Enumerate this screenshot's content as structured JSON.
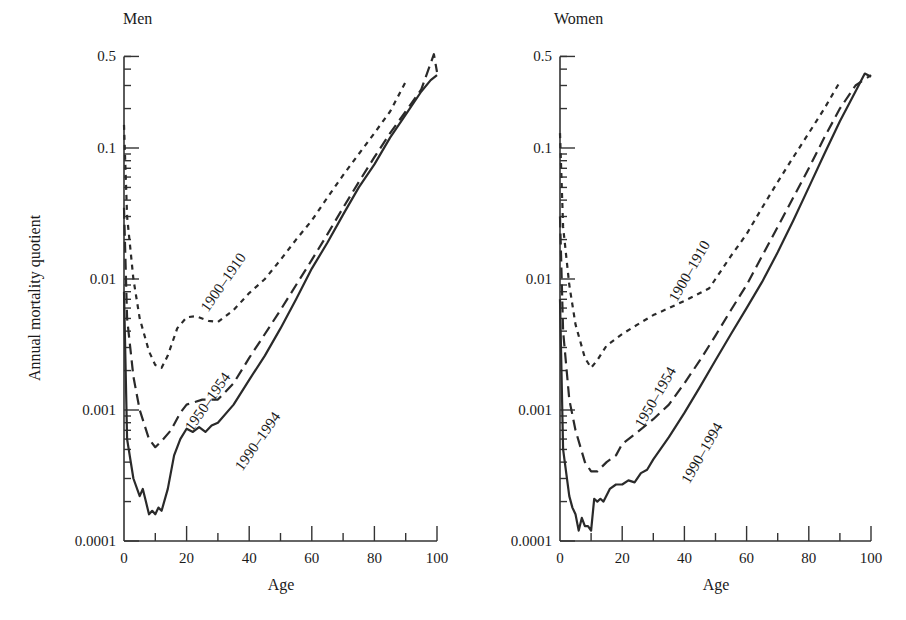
{
  "chart_data": [
    {
      "type": "line",
      "title": "Men",
      "xlabel": "Age",
      "ylabel": "Annual mortality quotient",
      "yscale": "log",
      "xlim": [
        0,
        100
      ],
      "ylim": [
        0.0001,
        0.5
      ],
      "x_ticks": [
        "0",
        "20",
        "40",
        "60",
        "80",
        "100"
      ],
      "y_ticks": [
        "0.0001",
        "0.001",
        "0.01",
        "0.1",
        "0.5"
      ],
      "grid": false,
      "series": [
        {
          "name": "1900–1910",
          "style": "dotted",
          "label": "1900–1910",
          "points": [
            [
              0,
              0.15
            ],
            [
              1,
              0.03
            ],
            [
              3,
              0.01
            ],
            [
              5,
              0.005
            ],
            [
              8,
              0.0028
            ],
            [
              10,
              0.0022
            ],
            [
              12,
              0.0021
            ],
            [
              14,
              0.0026
            ],
            [
              17,
              0.0042
            ],
            [
              20,
              0.0051
            ],
            [
              23,
              0.0052
            ],
            [
              27,
              0.0048
            ],
            [
              30,
              0.0047
            ],
            [
              35,
              0.0058
            ],
            [
              40,
              0.0078
            ],
            [
              45,
              0.01
            ],
            [
              50,
              0.014
            ],
            [
              55,
              0.02
            ],
            [
              60,
              0.028
            ],
            [
              65,
              0.042
            ],
            [
              70,
              0.062
            ],
            [
              75,
              0.09
            ],
            [
              80,
              0.13
            ],
            [
              85,
              0.19
            ],
            [
              90,
              0.32
            ]
          ]
        },
        {
          "name": "1950–1954",
          "style": "dashed",
          "label": "1950–1954",
          "points": [
            [
              0,
              0.035
            ],
            [
              1,
              0.005
            ],
            [
              3,
              0.0018
            ],
            [
              5,
              0.001
            ],
            [
              8,
              0.0006
            ],
            [
              10,
              0.00052
            ],
            [
              12,
              0.00058
            ],
            [
              15,
              0.0007
            ],
            [
              18,
              0.00095
            ],
            [
              20,
              0.0011
            ],
            [
              25,
              0.0012
            ],
            [
              30,
              0.0012
            ],
            [
              35,
              0.0016
            ],
            [
              40,
              0.0025
            ],
            [
              45,
              0.0038
            ],
            [
              50,
              0.0058
            ],
            [
              55,
              0.009
            ],
            [
              60,
              0.014
            ],
            [
              65,
              0.022
            ],
            [
              70,
              0.035
            ],
            [
              75,
              0.055
            ],
            [
              80,
              0.085
            ],
            [
              85,
              0.13
            ],
            [
              90,
              0.19
            ],
            [
              95,
              0.28
            ],
            [
              99,
              0.52
            ],
            [
              100,
              0.38
            ]
          ]
        },
        {
          "name": "1990–1994",
          "style": "solid",
          "label": "1990–1994",
          "points": [
            [
              0,
              0.008
            ],
            [
              1,
              0.0006
            ],
            [
              3,
              0.0003
            ],
            [
              5,
              0.00022
            ],
            [
              6,
              0.00025
            ],
            [
              7,
              0.0002
            ],
            [
              8,
              0.00016
            ],
            [
              9,
              0.00017
            ],
            [
              10,
              0.00016
            ],
            [
              11,
              0.00018
            ],
            [
              12,
              0.00017
            ],
            [
              14,
              0.00025
            ],
            [
              16,
              0.00045
            ],
            [
              18,
              0.0006
            ],
            [
              20,
              0.00072
            ],
            [
              22,
              0.00068
            ],
            [
              24,
              0.00074
            ],
            [
              26,
              0.00068
            ],
            [
              28,
              0.00076
            ],
            [
              30,
              0.0008
            ],
            [
              35,
              0.0011
            ],
            [
              40,
              0.0017
            ],
            [
              45,
              0.0026
            ],
            [
              50,
              0.0042
            ],
            [
              55,
              0.007
            ],
            [
              60,
              0.012
            ],
            [
              65,
              0.019
            ],
            [
              70,
              0.031
            ],
            [
              75,
              0.05
            ],
            [
              80,
              0.075
            ],
            [
              85,
              0.12
            ],
            [
              90,
              0.18
            ],
            [
              95,
              0.27
            ],
            [
              98,
              0.33
            ],
            [
              100,
              0.36
            ]
          ]
        }
      ]
    },
    {
      "type": "line",
      "title": "Women",
      "xlabel": "Age",
      "ylabel": "",
      "yscale": "log",
      "xlim": [
        0,
        100
      ],
      "ylim": [
        0.0001,
        0.5
      ],
      "x_ticks": [
        "0",
        "20",
        "40",
        "60",
        "80",
        "100"
      ],
      "y_ticks": [
        "0.0001",
        "0.001",
        "0.01",
        "0.1",
        "0.5"
      ],
      "grid": false,
      "series": [
        {
          "name": "1900–1910",
          "style": "dotted",
          "label": "1900–1910",
          "points": [
            [
              0,
              0.13
            ],
            [
              1,
              0.025
            ],
            [
              3,
              0.009
            ],
            [
              5,
              0.0045
            ],
            [
              8,
              0.0025
            ],
            [
              10,
              0.0021
            ],
            [
              12,
              0.0024
            ],
            [
              15,
              0.0031
            ],
            [
              20,
              0.0038
            ],
            [
              25,
              0.0045
            ],
            [
              30,
              0.0053
            ],
            [
              35,
              0.006
            ],
            [
              40,
              0.0068
            ],
            [
              45,
              0.0078
            ],
            [
              48,
              0.0085
            ],
            [
              50,
              0.01
            ],
            [
              55,
              0.015
            ],
            [
              60,
              0.022
            ],
            [
              65,
              0.035
            ],
            [
              70,
              0.055
            ],
            [
              75,
              0.085
            ],
            [
              80,
              0.13
            ],
            [
              85,
              0.2
            ],
            [
              90,
              0.32
            ]
          ]
        },
        {
          "name": "1950–1954",
          "style": "dashed",
          "label": "1950–1954",
          "points": [
            [
              0,
              0.03
            ],
            [
              1,
              0.004
            ],
            [
              3,
              0.0012
            ],
            [
              5,
              0.0007
            ],
            [
              8,
              0.0004
            ],
            [
              10,
              0.00034
            ],
            [
              12,
              0.00034
            ],
            [
              15,
              0.0004
            ],
            [
              18,
              0.00045
            ],
            [
              20,
              0.00055
            ],
            [
              25,
              0.00068
            ],
            [
              30,
              0.00085
            ],
            [
              35,
              0.0011
            ],
            [
              40,
              0.0016
            ],
            [
              45,
              0.0024
            ],
            [
              50,
              0.0037
            ],
            [
              55,
              0.0058
            ],
            [
              60,
              0.009
            ],
            [
              65,
              0.015
            ],
            [
              70,
              0.025
            ],
            [
              75,
              0.042
            ],
            [
              80,
              0.07
            ],
            [
              85,
              0.12
            ],
            [
              90,
              0.2
            ],
            [
              95,
              0.3
            ],
            [
              100,
              0.36
            ]
          ]
        },
        {
          "name": "1990–1994",
          "style": "solid",
          "label": "1990–1994",
          "points": [
            [
              0,
              0.007
            ],
            [
              1,
              0.0005
            ],
            [
              3,
              0.00022
            ],
            [
              4,
              0.00018
            ],
            [
              5,
              0.00016
            ],
            [
              6,
              0.00012
            ],
            [
              7,
              0.00015
            ],
            [
              8,
              0.00013
            ],
            [
              9,
              0.00013
            ],
            [
              10,
              0.00012
            ],
            [
              11,
              0.00021
            ],
            [
              12,
              0.0002
            ],
            [
              13,
              0.00021
            ],
            [
              14,
              0.0002
            ],
            [
              16,
              0.00025
            ],
            [
              18,
              0.00027
            ],
            [
              20,
              0.00027
            ],
            [
              22,
              0.00029
            ],
            [
              24,
              0.00028
            ],
            [
              26,
              0.00033
            ],
            [
              28,
              0.00035
            ],
            [
              30,
              0.00042
            ],
            [
              35,
              0.00062
            ],
            [
              40,
              0.00095
            ],
            [
              45,
              0.0015
            ],
            [
              50,
              0.0024
            ],
            [
              55,
              0.0038
            ],
            [
              60,
              0.006
            ],
            [
              65,
              0.0095
            ],
            [
              70,
              0.016
            ],
            [
              75,
              0.028
            ],
            [
              80,
              0.05
            ],
            [
              85,
              0.09
            ],
            [
              90,
              0.16
            ],
            [
              95,
              0.27
            ],
            [
              98,
              0.37
            ],
            [
              100,
              0.35
            ]
          ]
        }
      ]
    }
  ],
  "panels": {
    "men_title": "Men",
    "women_title": "Women",
    "ylabel": "Annual mortality quotient",
    "xlabel": "Age"
  }
}
